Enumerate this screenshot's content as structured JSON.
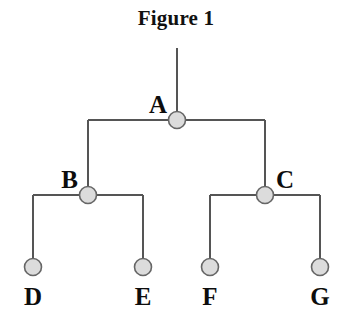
{
  "figure": {
    "title": "Figure 1",
    "type": "binary-tree-diagram"
  },
  "style": {
    "background_color": "#ffffff",
    "line_color": "#555555",
    "line_width": 2,
    "node_fill_color": "#dcdcdc",
    "node_stroke_color": "#666666",
    "node_radius": 8.5,
    "label_color": "#0d0d0d"
  },
  "tree": {
    "root_stem": {
      "x": 177,
      "y_top": 48,
      "y_bottom": 120
    },
    "nodes": [
      {
        "id": "A",
        "label": "A",
        "x": 177,
        "y": 120,
        "level": 0,
        "label_position": "left",
        "label_x": 167,
        "label_y": 92
      },
      {
        "id": "B",
        "label": "B",
        "x": 88,
        "y": 195,
        "level": 1,
        "label_position": "left",
        "label_x": 78,
        "label_y": 167
      },
      {
        "id": "C",
        "label": "C",
        "x": 265,
        "y": 195,
        "level": 1,
        "label_position": "right",
        "label_x": 276,
        "label_y": 167
      },
      {
        "id": "D",
        "label": "D",
        "x": 33,
        "y": 267,
        "level": 2,
        "label_position": "below",
        "label_x": 33,
        "label_y": 284
      },
      {
        "id": "E",
        "label": "E",
        "x": 143,
        "y": 267,
        "level": 2,
        "label_position": "below",
        "label_x": 143,
        "label_y": 284
      },
      {
        "id": "F",
        "label": "F",
        "x": 210,
        "y": 267,
        "level": 2,
        "label_position": "below",
        "label_x": 210,
        "label_y": 284
      },
      {
        "id": "G",
        "label": "G",
        "x": 320,
        "y": 267,
        "level": 2,
        "label_position": "below",
        "label_x": 320,
        "label_y": 284
      }
    ],
    "edges": [
      {
        "parent": "A",
        "child": "B",
        "bar_y": 120
      },
      {
        "parent": "A",
        "child": "C",
        "bar_y": 120
      },
      {
        "parent": "B",
        "child": "D",
        "bar_y": 195
      },
      {
        "parent": "B",
        "child": "E",
        "bar_y": 195
      },
      {
        "parent": "C",
        "child": "F",
        "bar_y": 195
      },
      {
        "parent": "C",
        "child": "G",
        "bar_y": 195
      }
    ]
  }
}
